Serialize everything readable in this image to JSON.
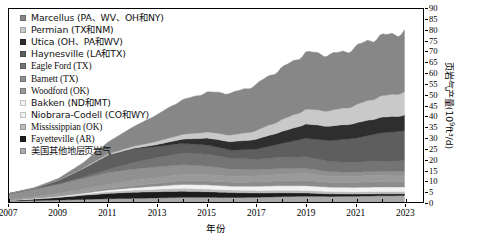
{
  "chart_data": {
    "type": "area",
    "title": "",
    "xlabel": "年份",
    "ylabel": "页岩气产量(10⁹ft³/d)",
    "ylabel_base": "页岩气产量(10",
    "ylabel_exp": "9",
    "ylabel_tail": "ft³/d)",
    "xlim": [
      2007,
      2023.75
    ],
    "ylim": [
      0,
      90
    ],
    "grid": false,
    "legend_position": "top-left",
    "stacked": true,
    "xticks": [
      "2007",
      "2009",
      "2011",
      "2013",
      "2015",
      "2017",
      "2019",
      "2021",
      "2023"
    ],
    "xtick_values": [
      2007,
      2009,
      2011,
      2013,
      2015,
      2017,
      2019,
      2021,
      2023
    ],
    "yticks": [
      "0",
      "5",
      "10",
      "15",
      "20",
      "25",
      "30",
      "35",
      "40",
      "45",
      "50",
      "55",
      "60",
      "65",
      "70",
      "75",
      "80",
      "85",
      "90"
    ],
    "ytick_values": [
      0,
      5,
      10,
      15,
      20,
      25,
      30,
      35,
      40,
      45,
      50,
      55,
      60,
      65,
      70,
      75,
      80,
      85,
      90
    ],
    "x": [
      2007,
      2008,
      2009,
      2010,
      2011,
      2012,
      2013,
      2014,
      2015,
      2016,
      2017,
      2018,
      2019,
      2020,
      2021,
      2022,
      2023
    ],
    "series": [
      {
        "name": "美国其他地层页岩气",
        "color": "#a9a9a9",
        "stack_order": 1,
        "values": [
          0.5,
          0.7,
          0.9,
          1.2,
          1.5,
          1.7,
          1.9,
          2.2,
          2.2,
          2.1,
          2.2,
          2.5,
          2.7,
          2.6,
          2.7,
          2.9,
          3.0
        ]
      },
      {
        "name": "Fayetteville (AR)",
        "color": "#1c1c1c",
        "stack_order": 2,
        "values": [
          0.2,
          0.6,
          1.2,
          1.9,
          2.5,
          2.8,
          2.9,
          2.8,
          2.6,
          2.3,
          2.0,
          1.8,
          1.5,
          1.2,
          1.0,
          0.9,
          0.8
        ]
      },
      {
        "name": "Mississippian (OK)",
        "color": "#bdbdbd",
        "stack_order": 3,
        "values": [
          0.1,
          0.2,
          0.3,
          0.5,
          0.8,
          1.0,
          1.2,
          1.4,
          1.3,
          1.2,
          1.2,
          1.2,
          1.2,
          1.1,
          1.1,
          1.1,
          1.1
        ]
      },
      {
        "name": "Niobrara-Codell (CO和WY)",
        "color": "#f2f2f2",
        "stack_order": 4,
        "values": [
          0.1,
          0.2,
          0.3,
          0.5,
          0.8,
          1.1,
          1.4,
          1.8,
          1.9,
          1.8,
          1.9,
          2.1,
          2.2,
          2.0,
          2.0,
          2.1,
          2.1
        ]
      },
      {
        "name": "Bakken (ND和MT)",
        "color": "#8c8c8c",
        "stack_order": 5,
        "values": [
          0.1,
          0.2,
          0.3,
          0.5,
          0.8,
          1.1,
          1.4,
          1.8,
          1.9,
          1.8,
          2.0,
          2.3,
          2.6,
          2.3,
          2.4,
          2.6,
          2.7
        ]
      },
      {
        "name": "Woodford (OK)",
        "color": "#9a9a9a",
        "stack_order": 6,
        "values": [
          0.3,
          0.6,
          1.0,
          1.4,
          1.9,
          2.3,
          2.6,
          2.9,
          2.9,
          2.7,
          2.8,
          3.0,
          3.1,
          2.8,
          2.8,
          2.9,
          2.9
        ]
      },
      {
        "name": "Barnett (TX)",
        "color": "#909090",
        "stack_order": 7,
        "values": [
          2.6,
          3.6,
          4.4,
          5.0,
          5.4,
          5.3,
          5.0,
          4.5,
          4.0,
          3.4,
          3.0,
          2.7,
          2.4,
          2.1,
          1.9,
          1.8,
          1.7
        ]
      },
      {
        "name": "Eagle Ford (TX)",
        "color": "#747474",
        "stack_order": 8,
        "values": [
          0.0,
          0.0,
          0.1,
          0.5,
          1.5,
          3.0,
          4.3,
          5.3,
          5.6,
          5.0,
          4.9,
          5.2,
          5.4,
          4.7,
          4.6,
          4.8,
          4.9
        ]
      },
      {
        "name": "Haynesville (LA和TX)",
        "color": "#5e5e5e",
        "stack_order": 9,
        "values": [
          0.0,
          0.2,
          1.5,
          4.0,
          6.5,
          6.3,
          5.2,
          4.6,
          4.2,
          3.9,
          4.6,
          6.4,
          8.6,
          9.8,
          11.2,
          13.0,
          14.0
        ]
      },
      {
        "name": "Utica (OH、PA和WV)",
        "color": "#2e2e2e",
        "stack_order": 10,
        "values": [
          0.0,
          0.0,
          0.0,
          0.0,
          0.1,
          0.3,
          0.9,
          2.0,
          3.2,
          3.9,
          4.6,
          5.5,
          6.6,
          6.7,
          7.0,
          7.2,
          7.3
        ]
      },
      {
        "name": "Permian (TX和NM)",
        "color": "#c9c9c9",
        "stack_order": 11,
        "values": [
          0.0,
          0.0,
          0.1,
          0.3,
          0.6,
          1.0,
          1.5,
          2.2,
          2.8,
          3.1,
          4.0,
          5.4,
          6.8,
          7.2,
          8.3,
          9.8,
          10.8
        ]
      },
      {
        "name": "Marcellus (PA、WV、OH和NY)",
        "color": "#878787",
        "stack_order": 12,
        "values": [
          0.1,
          0.3,
          0.9,
          2.5,
          5.5,
          9.0,
          12.5,
          16.0,
          18.5,
          19.5,
          21.5,
          24.0,
          26.5,
          26.0,
          27.0,
          28.0,
          28.5
        ]
      }
    ],
    "totals": [
      4.0,
      6.6,
      11.0,
      18.3,
      27.9,
      34.9,
      40.8,
      47.5,
      51.1,
      50.7,
      54.7,
      62.1,
      69.6,
      68.5,
      72.0,
      77.1,
      79.8
    ]
  },
  "legend": {
    "items": [
      {
        "label": "Marcellus (PA、WV、OH和NY)",
        "color": "#878787"
      },
      {
        "label": "Permian (TX和NM)",
        "color": "#c9c9c9"
      },
      {
        "label": "Utica (OH、PA和WV)",
        "color": "#2e2e2e"
      },
      {
        "label": "Haynesville (LA和TX)",
        "color": "#5e5e5e"
      },
      {
        "label": "Eagle Ford (TX)",
        "color": "#747474"
      },
      {
        "label": "Barnett (TX)",
        "color": "#909090"
      },
      {
        "label": "Woodford (OK)",
        "color": "#9a9a9a"
      },
      {
        "label": "Bakken (ND和MT)",
        "color": "#f2f2f2"
      },
      {
        "label": "Niobrara-Codell (CO和WY)",
        "color": "#f2f2f2"
      },
      {
        "label": "Mississippian (OK)",
        "color": "#bdbdbd"
      },
      {
        "label": "Fayetteville (AR)",
        "color": "#1c1c1c"
      },
      {
        "label": "美国其他地层页岩气",
        "color": "#a9a9a9"
      }
    ]
  }
}
